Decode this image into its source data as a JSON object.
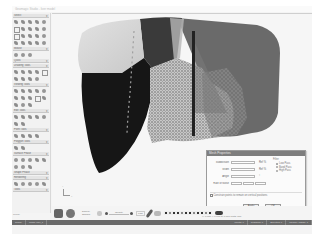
{
  "app": {
    "title": "Geomagic Studio - liver model"
  },
  "sidebar": {
    "sections": [
      {
        "title": "Select",
        "tools": 20
      },
      {
        "title": "Mouse",
        "tools": 3
      },
      {
        "title": "Quick",
        "tools": 0
      },
      {
        "title": "Drawing Tools",
        "tools": 10
      },
      {
        "title": "Viewing Tools",
        "tools": 15
      },
      {
        "title": "Edit Tools",
        "tools": 10
      },
      {
        "title": "Point Tools",
        "tools": 4
      },
      {
        "title": "Polygon Tools",
        "tools": 2
      },
      {
        "title": "Surface Phase",
        "tools": 10
      },
      {
        "title": "Shape Phase",
        "tools": 0
      },
      {
        "title": "Rendering",
        "tools": 5
      },
      {
        "title": "Tools",
        "tools": 0
      }
    ],
    "footer": "Ready"
  },
  "viewport": {
    "axis_labels": {
      "x": "X",
      "y": "Y"
    },
    "model_colors": {
      "light_lobe": "#d6d6d6",
      "dark_lobe": "#151515",
      "mid_right": "#5a5a5a",
      "mid_top": "#3c3c3c",
      "mesh": "#9a9a9a",
      "background": "#f6f6f6"
    }
  },
  "dialog": {
    "title": "Mesh Properties",
    "fields": [
      {
        "label": "Subdivision",
        "unit": "Ref %"
      },
      {
        "label": "Width",
        "unit": "Ref %"
      },
      {
        "label": "Angle",
        "unit": "°"
      },
      {
        "label": "Rate of Noise",
        "unit": ""
      }
    ],
    "group_title": "Filter",
    "radios": [
      {
        "label": "Low Pass",
        "selected": true
      },
      {
        "label": "Band Pass",
        "selected": false
      },
      {
        "label": "High Pass",
        "selected": false
      }
    ],
    "checkbox_label": "Constrain points to remain on vertical positions",
    "buttons": {
      "ok": "Apply",
      "cancel": "OK"
    }
  },
  "bottombar": {
    "display_label": "Display",
    "display_value": "Shaded",
    "opacity_label": "Opacity",
    "small_button": "Fast"
  },
  "statusbar": {
    "cells": [
      "Ready",
      "Mesh: liver_1",
      "Points: 0",
      "Triangles: 0",
      "Selected: 0",
      "Memory Usage: 0"
    ],
    "coords": "X: 0.000  Y: 0.000  Z: 0.000  Units: mm"
  }
}
